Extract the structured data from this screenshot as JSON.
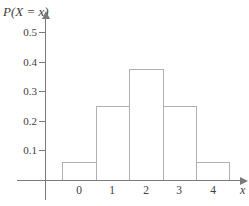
{
  "labels": {
    "y_axis_title": "P(X = x)",
    "x_axis_label": "x"
  },
  "chart_data": {
    "type": "bar",
    "title": "",
    "ylabel": "P(X = x)",
    "xlabel": "x",
    "categories": [
      "0",
      "1",
      "2",
      "3",
      "4"
    ],
    "values": [
      0.0625,
      0.25,
      0.375,
      0.25,
      0.0625
    ],
    "y_ticks": [
      0.1,
      0.2,
      0.3,
      0.4,
      0.5
    ],
    "ylim": [
      0,
      0.55
    ],
    "grid": false,
    "legend": false,
    "bar_fill": "#ffffff",
    "bar_border_color": "#b0b0b0",
    "axis_color": "#7a7a7a",
    "text_color": "#3d3d3d"
  }
}
